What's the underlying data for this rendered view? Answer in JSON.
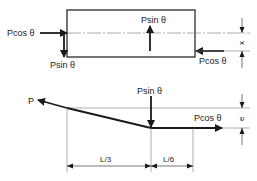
{
  "diagram": {
    "top_figure": {
      "labels": {
        "left_axial": "Pcos θ",
        "left_transverse": "Psin θ",
        "center_transverse": "Psin θ",
        "right_axial": "Pcos θ",
        "offset_dim": "x"
      }
    },
    "bottom_figure": {
      "labels": {
        "tendon_force": "P",
        "deviation_force": "Psin θ",
        "right_axial": "Pcos θ",
        "eccentricity_dim": "e",
        "span_left": "L/3",
        "span_right": "L/6"
      }
    },
    "colors": {
      "line": "#1a1a1a",
      "thin_line": "#555555",
      "background": "#ffffff"
    }
  }
}
